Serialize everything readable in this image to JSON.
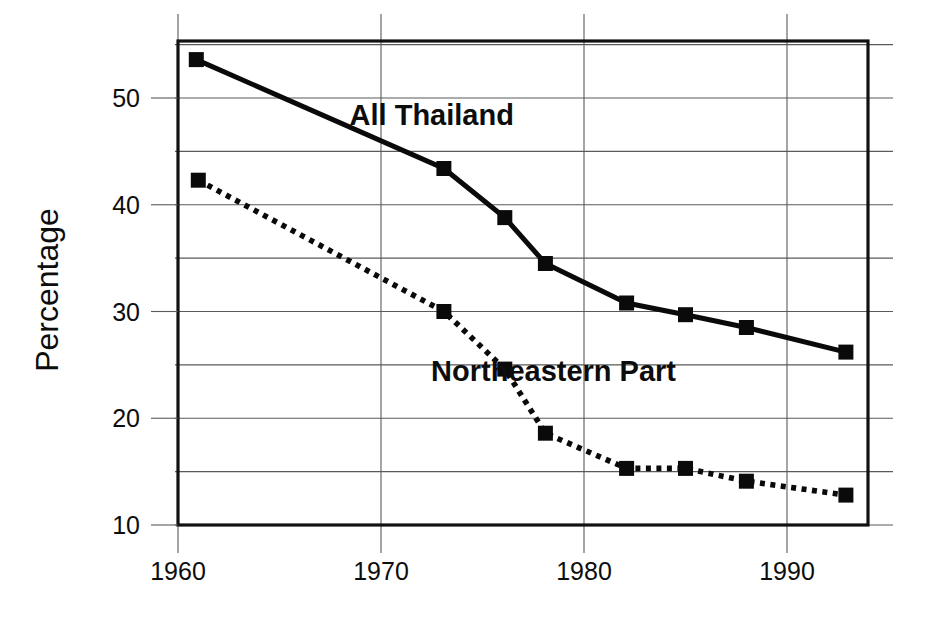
{
  "chart_data": {
    "type": "line",
    "title": "",
    "xlabel": "",
    "ylabel": "Percentage",
    "xlim": [
      1958.5,
      1994.5
    ],
    "ylim": [
      10,
      55
    ],
    "xticks": [
      "1960",
      "1970",
      "1980",
      "1990"
    ],
    "xtick_values": [
      1960,
      1970,
      1980,
      1990
    ],
    "yticks": [
      "10",
      "20",
      "30",
      "40",
      "50"
    ],
    "ytick_values": [
      10,
      20,
      30,
      40,
      50
    ],
    "minor_ytick_values": [
      15,
      25,
      35,
      45,
      55
    ],
    "grid": true,
    "legend_position": "inline-annotation",
    "series": [
      {
        "name": "All Thailand",
        "style": "solid",
        "marker": "square",
        "x": [
          1960.9,
          1973.1,
          1976.1,
          1978.1,
          1982.1,
          1985.0,
          1988.0,
          1992.9
        ],
        "values": [
          53.6,
          43.4,
          38.8,
          34.5,
          30.8,
          29.7,
          28.5,
          26.2
        ]
      },
      {
        "name": "Northeastern Part",
        "style": "dotted",
        "marker": "square",
        "x": [
          1961.0,
          1973.1,
          1976.1,
          1978.1,
          1982.1,
          1985.0,
          1988.0,
          1992.9
        ],
        "values": [
          42.3,
          30.0,
          24.6,
          18.6,
          15.3,
          15.3,
          14.1,
          12.8
        ]
      }
    ],
    "annotations": [
      {
        "text": "All Thailand",
        "x": 1972.5,
        "y": 47.5
      },
      {
        "text": "Northeastern Part",
        "x": 1978.5,
        "y": 23.5
      }
    ],
    "colors": {
      "line": "#0a0a0a",
      "grid": "#5a5a5a",
      "frame": "#111111",
      "background": "#ffffff"
    }
  }
}
